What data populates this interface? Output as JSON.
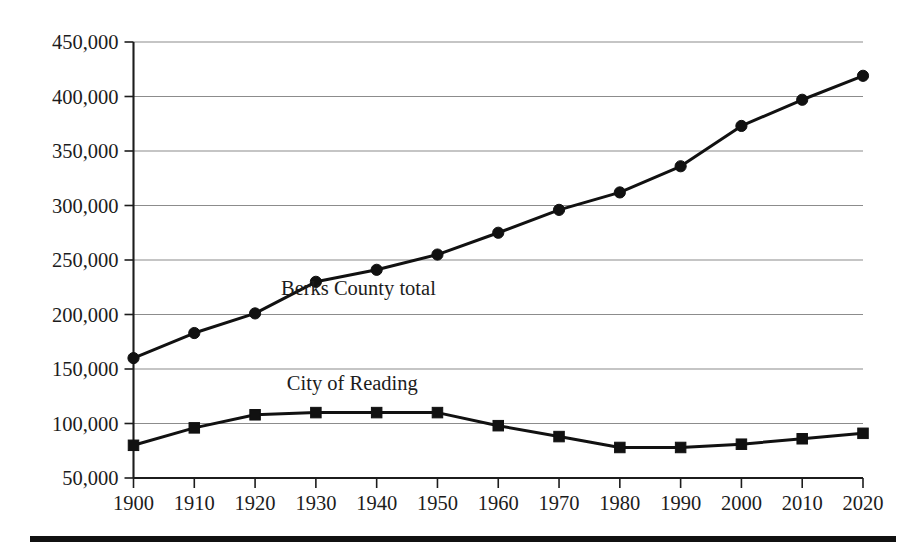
{
  "chart_data": {
    "type": "line",
    "title": "",
    "subtitle": "",
    "xlabel": "",
    "ylabel": "",
    "categories": [
      1900,
      1910,
      1920,
      1930,
      1940,
      1950,
      1960,
      1970,
      1980,
      1990,
      2000,
      2010,
      2020
    ],
    "x_tick_labels": [
      "1900",
      "1910",
      "1920",
      "1930",
      "1940",
      "1950",
      "1960",
      "1970",
      "1980",
      "1990",
      "2000",
      "2010",
      "2020"
    ],
    "y_tick_values": [
      50000,
      100000,
      150000,
      200000,
      250000,
      300000,
      350000,
      400000,
      450000
    ],
    "y_tick_labels": [
      "50,000",
      "100,000",
      "150,000",
      "200,000",
      "250,000",
      "300,000",
      "350,000",
      "400,000",
      "450,000"
    ],
    "ylim": [
      50000,
      450000
    ],
    "xlim": [
      1900,
      2020
    ],
    "grid": true,
    "grid_axis": "y",
    "legend_position": "inline-annotation",
    "series": [
      {
        "name": "Berks County total",
        "marker": "circle",
        "color": "#111111",
        "label_x": 1937,
        "label_y": 218000,
        "values": [
          160000,
          183000,
          201000,
          230000,
          241000,
          255000,
          275000,
          296000,
          312000,
          336000,
          373000,
          397000,
          419000
        ]
      },
      {
        "name": "City of Reading",
        "marker": "square",
        "color": "#111111",
        "label_x": 1936,
        "label_y": 131000,
        "values": [
          80000,
          96000,
          108000,
          110000,
          110000,
          110000,
          98000,
          88000,
          78000,
          78000,
          81000,
          86000,
          91000
        ]
      }
    ]
  },
  "annotations": {
    "series_label_1": "Berks County total",
    "series_label_2": "City of Reading"
  }
}
